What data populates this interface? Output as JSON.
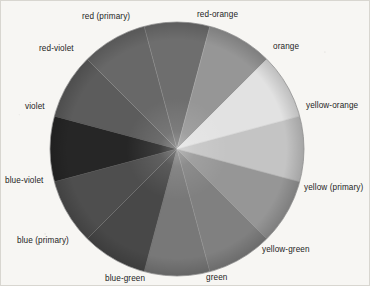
{
  "figure": {
    "type": "color-wheel-diagram",
    "rendering": "grayscale pencil-shaded circular color wheel on paper",
    "background_color": "#f7f6f3",
    "label_color": "#1d1d1d",
    "center": {
      "x": 176,
      "y": 148
    },
    "radius": 128,
    "segment_count": 12
  },
  "chart_data": {
    "type": "pie",
    "title": "",
    "subtitle": "",
    "xlabel": "",
    "ylabel": "",
    "legend_position": "around-perimeter",
    "grid": false,
    "equal_slices": true,
    "slice_angle_degrees": 30,
    "categories": [
      "red (primary)",
      "red-orange",
      "orange",
      "yellow-orange",
      "yellow (primary)",
      "yellow-green",
      "green",
      "blue-green",
      "blue (primary)",
      "blue-violet",
      "violet",
      "red-violet"
    ],
    "values": [
      30,
      30,
      30,
      30,
      30,
      30,
      30,
      30,
      30,
      30,
      30,
      30
    ],
    "series": [
      {
        "name": "grayscale value",
        "values": [
          92,
          104,
          110,
          150,
          226,
          196,
          150,
          128,
          120,
          72,
          78,
          38
        ]
      }
    ],
    "slices": [
      {
        "label": "red (primary)",
        "start_angle": -75,
        "end_angle": -45,
        "gray": "#5c5c5c",
        "gray_value": 92,
        "label_position": "top-left-of-top"
      },
      {
        "label": "red-orange",
        "start_angle": -45,
        "end_angle": -15,
        "gray": "#686868",
        "gray_value": 104,
        "label_position": "top-right-of-top"
      },
      {
        "label": "orange",
        "start_angle": -15,
        "end_angle": 15,
        "gray": "#6e6e6e",
        "gray_value": 110,
        "label_position": "upper-right"
      },
      {
        "label": "yellow-orange",
        "start_angle": 15,
        "end_angle": 45,
        "gray": "#969696",
        "gray_value": 150,
        "label_position": "right-upper"
      },
      {
        "label": "yellow (primary)",
        "start_angle": 45,
        "end_angle": 75,
        "gray": "#e2e2e2",
        "gray_value": 226,
        "label_position": "right"
      },
      {
        "label": "yellow-green",
        "start_angle": 75,
        "end_angle": 105,
        "gray": "#c4c4c4",
        "gray_value": 196,
        "label_position": "lower-right"
      },
      {
        "label": "green",
        "start_angle": 105,
        "end_angle": 135,
        "gray": "#969696",
        "gray_value": 150,
        "label_position": "bottom-right-of-bottom"
      },
      {
        "label": "blue-green",
        "start_angle": 135,
        "end_angle": 165,
        "gray": "#808080",
        "gray_value": 128,
        "label_position": "bottom-left-of-bottom"
      },
      {
        "label": "blue (primary)",
        "start_angle": 165,
        "end_angle": 195,
        "gray": "#787878",
        "gray_value": 120,
        "label_position": "lower-left"
      },
      {
        "label": "blue-violet",
        "start_angle": 195,
        "end_angle": 225,
        "gray": "#484848",
        "gray_value": 72,
        "label_position": "left"
      },
      {
        "label": "violet",
        "start_angle": 225,
        "end_angle": 255,
        "gray": "#4e4e4e",
        "gray_value": 78,
        "label_position": "left-upper"
      },
      {
        "label": "red-violet",
        "start_angle": 255,
        "end_angle": 285,
        "gray": "#262626",
        "gray_value": 38,
        "label_position": "upper-left"
      }
    ]
  },
  "labels": [
    {
      "id": "red-primary",
      "text": "red (primary)",
      "x": 81,
      "y": 12
    },
    {
      "id": "red-orange",
      "text": "red-orange",
      "x": 196,
      "y": 10
    },
    {
      "id": "orange",
      "text": "orange",
      "x": 272,
      "y": 42
    },
    {
      "id": "yellow-orange",
      "text": "yellow-orange",
      "x": 305,
      "y": 101
    },
    {
      "id": "yellow-primary",
      "text": "yellow (primary)",
      "x": 303,
      "y": 183
    },
    {
      "id": "yellow-green",
      "text": "yellow-green",
      "x": 261,
      "y": 245
    },
    {
      "id": "green",
      "text": "green",
      "x": 205,
      "y": 273
    },
    {
      "id": "blue-green",
      "text": "blue-green",
      "x": 104,
      "y": 274
    },
    {
      "id": "blue-primary",
      "text": "blue (primary)",
      "x": 16,
      "y": 236
    },
    {
      "id": "blue-violet",
      "text": "blue-violet",
      "x": 4,
      "y": 176
    },
    {
      "id": "violet",
      "text": "violet",
      "x": 24,
      "y": 102
    },
    {
      "id": "red-violet",
      "text": "red-violet",
      "x": 38,
      "y": 44
    }
  ]
}
